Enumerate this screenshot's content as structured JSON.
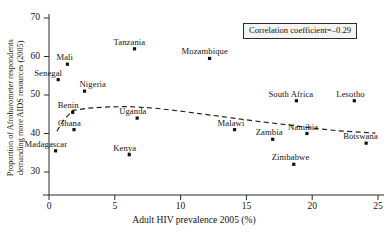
{
  "chart_data": {
    "type": "scatter",
    "title": "",
    "xlabel": "Adult HIV prevalence 2005 (%)",
    "ylabel": "Proportion of Afrobarometer respondents demanding more AIDS resources (2005)",
    "xlim": [
      0,
      25
    ],
    "ylim": [
      30,
      70
    ],
    "xticks": [
      "0",
      "5",
      "10",
      "15",
      "20",
      "25"
    ],
    "yticks": [
      "30",
      "40",
      "50",
      "60",
      "70"
    ],
    "grid": false,
    "legend": null,
    "annotation": "Correlation coefficient=–0.29",
    "correlation_coefficient": -0.29,
    "trend_line": {
      "style": "dashed",
      "points": [
        [
          0.6,
          40.6
        ],
        [
          1.1,
          43.4
        ],
        [
          1.8,
          46.0
        ],
        [
          3.0,
          46.6
        ],
        [
          4.5,
          46.9
        ],
        [
          6.0,
          47.0
        ],
        [
          8.0,
          46.6
        ],
        [
          10.0,
          45.8
        ],
        [
          12.0,
          44.9
        ],
        [
          14.0,
          44.0
        ],
        [
          16.0,
          43.1
        ],
        [
          18.0,
          42.3
        ],
        [
          20.0,
          41.4
        ],
        [
          22.0,
          40.7
        ],
        [
          24.8,
          40.1
        ]
      ]
    },
    "points": [
      {
        "name": "Madagascar",
        "x": 0.5,
        "y": 35.5,
        "label_dx": -31,
        "label_dy": -11
      },
      {
        "name": "Senegal",
        "x": 0.7,
        "y": 54.0,
        "label_dx": -24,
        "label_dy": -11
      },
      {
        "name": "Mali",
        "x": 1.4,
        "y": 58.0,
        "label_dx": -11,
        "label_dy": -11
      },
      {
        "name": "Benin",
        "x": 1.8,
        "y": 45.5,
        "label_dx": -15,
        "label_dy": -11
      },
      {
        "name": "Ghana",
        "x": 1.9,
        "y": 41.0,
        "label_dx": -16,
        "label_dy": -11
      },
      {
        "name": "Nigeria",
        "x": 2.7,
        "y": 51.0,
        "label_dx": -5,
        "label_dy": -11
      },
      {
        "name": "Kenya",
        "x": 6.1,
        "y": 34.5,
        "label_dx": -16,
        "label_dy": -11
      },
      {
        "name": "Tanzania",
        "x": 6.5,
        "y": 62.0,
        "label_dx": -21,
        "label_dy": -11
      },
      {
        "name": "Uganda",
        "x": 6.7,
        "y": 44.0,
        "label_dx": -18,
        "label_dy": -11
      },
      {
        "name": "Mozambique",
        "x": 12.2,
        "y": 59.5,
        "label_dx": -28,
        "label_dy": -11
      },
      {
        "name": "Malawi",
        "x": 14.1,
        "y": 41.0,
        "label_dx": -17,
        "label_dy": -11
      },
      {
        "name": "Zambia",
        "x": 17.0,
        "y": 38.5,
        "label_dx": -17,
        "label_dy": -11
      },
      {
        "name": "Zimbabwe",
        "x": 18.6,
        "y": 32.0,
        "label_dx": -22,
        "label_dy": -11
      },
      {
        "name": "South Africa",
        "x": 18.8,
        "y": 48.5,
        "label_dx": -28,
        "label_dy": -11
      },
      {
        "name": "Namibia",
        "x": 19.6,
        "y": 40.0,
        "label_dx": -19,
        "label_dy": -11
      },
      {
        "name": "Lesotho",
        "x": 23.2,
        "y": 48.5,
        "label_dx": -18,
        "label_dy": -11
      },
      {
        "name": "Botswana",
        "x": 24.1,
        "y": 37.5,
        "label_dx": -23,
        "label_dy": -11
      }
    ]
  }
}
